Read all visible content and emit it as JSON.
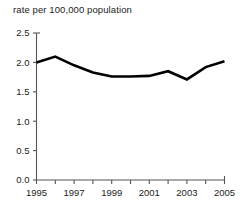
{
  "chart_data": {
    "type": "line",
    "title": "rate per 100,000 population",
    "subtitle": "",
    "xlabel": "",
    "ylabel": "",
    "x": [
      1995,
      1996,
      1997,
      1998,
      1999,
      2000,
      2001,
      2002,
      2003,
      2004,
      2005
    ],
    "values": [
      2.0,
      2.1,
      1.95,
      1.83,
      1.76,
      1.76,
      1.77,
      1.85,
      1.71,
      1.92,
      2.02
    ],
    "series": [
      {
        "name": "rate per 100,000 population",
        "values": [
          2.0,
          2.1,
          1.95,
          1.83,
          1.76,
          1.76,
          1.77,
          1.85,
          1.71,
          1.92,
          2.02
        ],
        "color": "#000000"
      }
    ],
    "xlim": [
      1995,
      2005
    ],
    "ylim": [
      0.0,
      2.5
    ],
    "ytick_labels": [
      "0.0",
      "0.5",
      "1.0",
      "1.5",
      "2.0",
      "2.5"
    ],
    "ytick_values": [
      0.0,
      0.5,
      1.0,
      1.5,
      2.0,
      2.5
    ],
    "xtick_labels": [
      "1995",
      "1997",
      "1999",
      "2001",
      "2003",
      "2005"
    ],
    "xtick_values": [
      1995,
      1997,
      1999,
      2001,
      2003,
      2005
    ],
    "xtick_minor_values": [
      1996,
      1998,
      2000,
      2002,
      2004
    ],
    "grid": false,
    "legend": "none",
    "line_width": 2.6,
    "markers": false,
    "axis_color": "#555555",
    "background": "#ffffff"
  },
  "footer": {
    "source_note": ""
  }
}
